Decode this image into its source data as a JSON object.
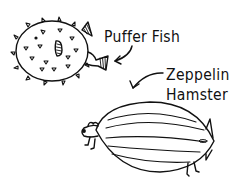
{
  "illustration": {
    "background": "#ffffff",
    "ink_color": "#111111",
    "creatures": [
      {
        "id": "puffer-fish",
        "label": "Puffer Fish",
        "description": "round spiky fish with hatched fins"
      },
      {
        "id": "zeppelin-hamster",
        "label_line1": "Zeppelin",
        "label_line2": "Hamster",
        "description": "blimp-shaped hamster with tail fins and legs"
      }
    ]
  }
}
